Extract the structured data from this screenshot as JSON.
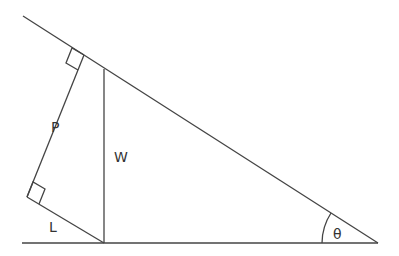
{
  "diagram": {
    "type": "force-diagram-inclined-plane",
    "labels": {
      "P": "P",
      "W": "W",
      "L": "L",
      "theta": "θ"
    },
    "colors": {
      "line": "#444444",
      "text": "#333333",
      "background": "#ffffff"
    }
  }
}
